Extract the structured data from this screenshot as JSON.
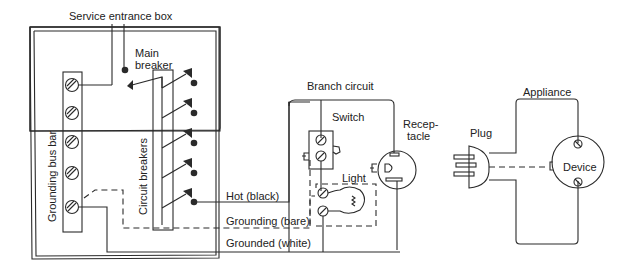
{
  "diagram": {
    "title": "Service entrance box",
    "service_box": {
      "main_breaker_line1": "Main",
      "main_breaker_line2": "breaker",
      "grounding_bus_bar": "Grounding bus bar",
      "circuit_breakers": "Circuit breakers"
    },
    "wires": {
      "hot": "Hot (black)",
      "grounding": "Grounding (bare)",
      "grounded": "Grounded (white)"
    },
    "branch_circuit": {
      "label": "Branch circuit",
      "switch": "Switch",
      "light": "Light",
      "receptacle_line1": "Recep-",
      "receptacle_line2": "tacle"
    },
    "appliance": {
      "label": "Appliance",
      "plug": "Plug",
      "device": "Device"
    }
  }
}
